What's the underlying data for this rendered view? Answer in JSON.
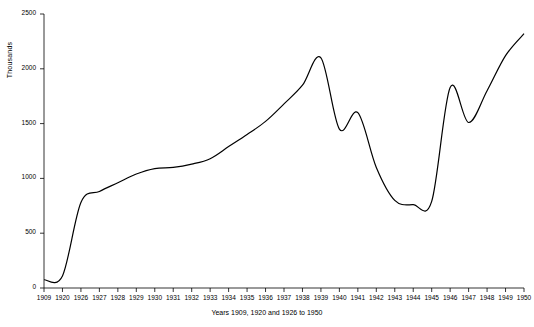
{
  "chart_data": {
    "type": "line",
    "title": "",
    "xlabel": "Years 1909, 1920 and 1926 to 1950",
    "ylabel": "Thousands",
    "xlim": [
      1909,
      1950
    ],
    "ylim": [
      0,
      2500
    ],
    "grid": false,
    "legend": false,
    "y_ticks": [
      0,
      500,
      1000,
      1500,
      2000,
      2500
    ],
    "x_ticks": [
      1909,
      1920,
      1926,
      1927,
      1928,
      1929,
      1930,
      1931,
      1932,
      1933,
      1934,
      1935,
      1936,
      1937,
      1938,
      1939,
      1940,
      1941,
      1942,
      1943,
      1944,
      1945,
      1946,
      1947,
      1948,
      1949,
      1950
    ],
    "series": [
      {
        "name": "Thousands",
        "color": "#000000",
        "x": [
          1909,
          1920,
          1926,
          1927,
          1928,
          1929,
          1930,
          1931,
          1932,
          1933,
          1934,
          1935,
          1936,
          1937,
          1938,
          1939,
          1940,
          1941,
          1942,
          1943,
          1944,
          1945,
          1946,
          1947,
          1948,
          1949,
          1950
        ],
        "values": [
          75,
          110,
          780,
          880,
          960,
          1040,
          1090,
          1100,
          1130,
          1180,
          1290,
          1400,
          1520,
          1680,
          1850,
          2100,
          1450,
          1600,
          1100,
          800,
          760,
          790,
          1830,
          1510,
          1800,
          2120,
          2320
        ]
      }
    ]
  }
}
